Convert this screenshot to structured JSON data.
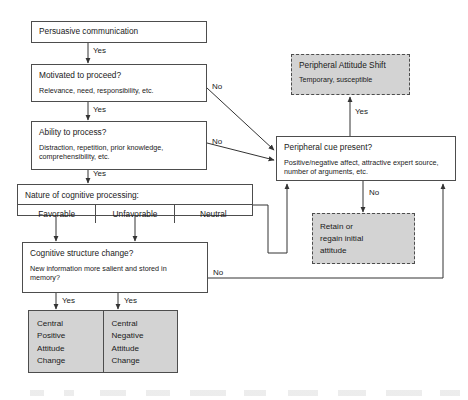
{
  "diagram": {
    "colors": {
      "shaded_fill": "#d3d3d3",
      "border": "#4d4d4d",
      "page_background": "#ffffff",
      "text": "#1a1a1a"
    }
  },
  "nodes": {
    "persuasive_communication": {
      "title": "Persuasive communication"
    },
    "motivated": {
      "title": "Motivated to proceed?",
      "sub": "Relevance, need, responsibility, etc."
    },
    "ability": {
      "title": "Ability to process?",
      "sub": "Distraction, repetition, prior knowledge, comprehensibility, etc."
    },
    "nature": {
      "title": "Nature of cognitive processing:",
      "cells": [
        "Favorable",
        "Unfavorable",
        "Neutral"
      ]
    },
    "cognitive_change": {
      "title": "Cognitive structure change?",
      "sub": "New information more salient and stored in memory?"
    },
    "peripheral_cue": {
      "title": "Peripheral cue present?",
      "sub": "Positive/negative affect, attractive expert source, number of arguments, etc."
    },
    "peripheral_shift": {
      "title": "Peripheral Attitude Shift",
      "sub": "Temporary, susceptible"
    },
    "retain": {
      "lines": [
        "Retain or",
        "regain initial",
        "attitude"
      ]
    },
    "outcome_positive": {
      "lines": [
        "Central",
        "Positive",
        "Attitude",
        "Change"
      ]
    },
    "outcome_negative": {
      "lines": [
        "Central",
        "Negative",
        "Attitude",
        "Change"
      ]
    }
  },
  "edges": {
    "yes_1": "Yes",
    "yes_2": "Yes",
    "yes_3": "Yes",
    "yes_peripheral": "Yes",
    "yes_left_outcome": "Yes",
    "yes_right_outcome": "Yes",
    "no_motivated": "No",
    "no_ability": "No",
    "no_peripheral": "No",
    "no_cognitive": "No"
  }
}
